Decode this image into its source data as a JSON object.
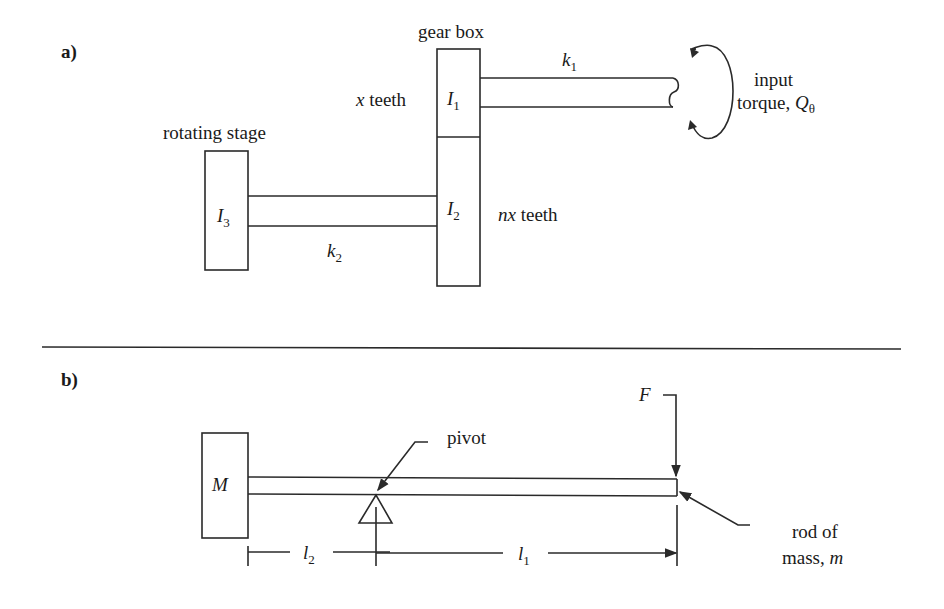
{
  "panel_a": {
    "label": "a)",
    "gear_box_label": "gear box",
    "rotating_stage_label": "rotating stage",
    "x_teeth": {
      "var": "x",
      "text": " teeth"
    },
    "nx_teeth": {
      "var": "nx",
      "text": " teeth"
    },
    "I1": {
      "base": "I",
      "sub": "1"
    },
    "I2": {
      "base": "I",
      "sub": "2"
    },
    "I3": {
      "base": "I",
      "sub": "3"
    },
    "k1": {
      "base": "k",
      "sub": "1"
    },
    "k2": {
      "base": "k",
      "sub": "2"
    },
    "input_line1": "input",
    "input_line2": "torque, ",
    "Q": {
      "base": "Q",
      "sub": "θ"
    }
  },
  "panel_b": {
    "label": "b)",
    "M_label": "M",
    "pivot_label": "pivot",
    "F_label": "F",
    "rod_line1": "rod of",
    "rod_line2": "mass, ",
    "m_var": "m",
    "l2": {
      "base": "l",
      "sub": "2"
    },
    "l1": {
      "base": "l",
      "sub": "1"
    }
  }
}
